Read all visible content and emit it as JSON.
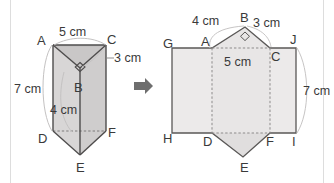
{
  "figure": {
    "background_color": "#ffffff",
    "stroke_color": "#5a5a5a",
    "dashed_color": "#8a8a8a",
    "arc_color": "#b9b9b9",
    "face_fill_light": "#eceaea",
    "face_fill_mid": "#e2e0e0",
    "face_fill_dark": "#d5d3d3",
    "label_color": "#3a3a3a",
    "border_color": "#d9d9d9",
    "arrow": {
      "icon": "right-arrow-icon",
      "color": "#6e6e6e"
    }
  },
  "prism": {
    "name": "triangular-prism",
    "vertices": {
      "A": "A",
      "B": "B",
      "C": "C",
      "D": "D",
      "E": "E",
      "F": "F"
    },
    "dimensions": {
      "top_edge": "5 cm",
      "right_edge": "3 cm",
      "left_height": "7 cm",
      "front_edge": "4 cm"
    },
    "right_angle_marker": "right-angle-at-B"
  },
  "net": {
    "name": "prism-net",
    "vertices": {
      "A": "A",
      "B": "B",
      "C": "C",
      "D": "D",
      "E": "E",
      "F": "F",
      "G": "G",
      "H": "H",
      "I": "I",
      "J": "J"
    },
    "dimensions": {
      "top_left_edge": "4 cm",
      "top_right_edge": "3 cm",
      "middle_edge": "5 cm",
      "right_height": "7 cm"
    },
    "right_angle_marker": "right-angle-at-B"
  }
}
